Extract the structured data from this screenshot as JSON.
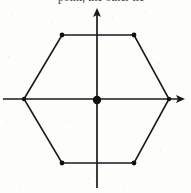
{
  "figure": {
    "caption_fragment": "point, the other lie",
    "background_color": "#fdfdfc",
    "ink_color": "#1a1a1a",
    "stroke_width": 1.6,
    "axes": {
      "x_axis": {
        "label": "x-axis",
        "y": 99,
        "x_start": 3,
        "x_end": 185,
        "arrow_at": "right"
      },
      "y_axis": {
        "label": "y-axis",
        "x": 97,
        "y_start": 8,
        "y_end": 188,
        "arrow_at": "top"
      },
      "origin": {
        "label": "origin",
        "x": 97,
        "y": 100,
        "marker": "filled-dot",
        "radius": 4.2
      }
    },
    "polygon": {
      "name": "regular-hexagon",
      "sides": 6,
      "vertex_marker": "filled-dot",
      "vertex_radius": 2.2,
      "vertices": [
        {
          "label": "left-vertex",
          "x": 24,
          "y": 99
        },
        {
          "label": "top-left-vertex",
          "x": 62,
          "y": 35
        },
        {
          "label": "top-right-vertex",
          "x": 134,
          "y": 35
        },
        {
          "label": "right-vertex",
          "x": 169,
          "y": 99
        },
        {
          "label": "bottom-right-vertex",
          "x": 134,
          "y": 163
        },
        {
          "label": "bottom-left-vertex",
          "x": 62,
          "y": 163
        }
      ],
      "points_path": "24,99 62,35 134,35 169,99 134,163 62,163"
    }
  }
}
